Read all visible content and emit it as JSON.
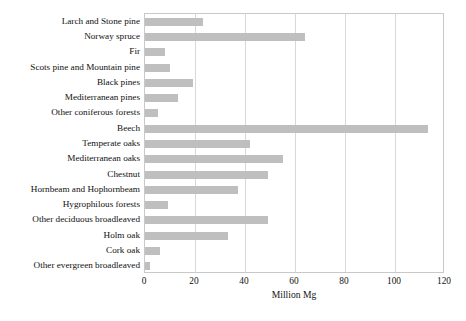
{
  "chart_data": {
    "type": "bar",
    "orientation": "horizontal",
    "title": "",
    "subtitle": "",
    "xlabel": "Million Mg",
    "ylabel": "",
    "xlim": [
      0,
      120
    ],
    "xticks": [
      0,
      20,
      40,
      60,
      80,
      100,
      120
    ],
    "grid": true,
    "legend": null,
    "bar_color": "#bfbfbf",
    "frame_color": "#c9c9c9",
    "categories": [
      "Larch and Stone pine",
      "Norway spruce",
      "Fir",
      "Scots pine and Mountain pine",
      "Black pines",
      "Mediterranean pines",
      "Other coniferous forests",
      "Beech",
      "Temperate oaks",
      "Mediterranean oaks",
      "Chestnut",
      "Hornbeam and Hophornbeam",
      "Hygrophilous forests",
      "Other deciduous broadleaved",
      "Holm oak",
      "Cork oak",
      "Other evergreen broadleaved"
    ],
    "values": [
      23,
      64,
      8,
      10,
      19,
      13,
      5,
      113,
      42,
      55,
      49,
      37,
      9,
      49,
      33,
      6,
      2
    ],
    "units": "Million Mg"
  }
}
